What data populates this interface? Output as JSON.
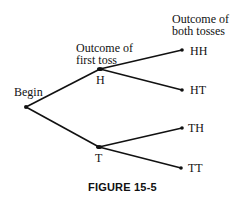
{
  "diagram": {
    "type": "tree",
    "caption": "FIGURE 15-5",
    "column_headers": {
      "first_toss": [
        "Outcome of",
        "first toss"
      ],
      "both_tosses": [
        "Outcome of",
        "both tosses"
      ]
    },
    "nodes": [
      {
        "id": "begin",
        "label": "Begin",
        "x": 26,
        "y": 107
      },
      {
        "id": "H",
        "label": "H",
        "x": 100,
        "y": 69
      },
      {
        "id": "T",
        "label": "T",
        "x": 99,
        "y": 147
      },
      {
        "id": "HH",
        "label": "HH",
        "x": 182,
        "y": 50
      },
      {
        "id": "HT",
        "label": "HT",
        "x": 182,
        "y": 90
      },
      {
        "id": "TH",
        "label": "TH",
        "x": 182,
        "y": 128
      },
      {
        "id": "TT",
        "label": "TT",
        "x": 181,
        "y": 168
      }
    ],
    "edges": [
      [
        "begin",
        "H"
      ],
      [
        "begin",
        "T"
      ],
      [
        "H",
        "HH"
      ],
      [
        "H",
        "HT"
      ],
      [
        "T",
        "TH"
      ],
      [
        "T",
        "TT"
      ]
    ],
    "line_color": "#111111"
  }
}
